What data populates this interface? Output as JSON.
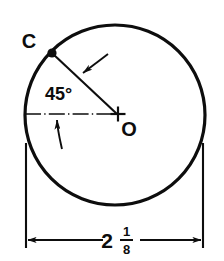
{
  "drawing": {
    "type": "engineering-drawing",
    "subject": "circle-with-angular-and-diameter-dimensions",
    "background_color": "#ffffff",
    "line_color": "#0d0d0d",
    "geometry": {
      "circle": {
        "center_x": 115,
        "center_y": 115,
        "radius": 90,
        "stroke_width": 3.2
      },
      "center_mark": {
        "x": 118,
        "y": 114,
        "arm_length": 7
      },
      "point_c": {
        "x": 52,
        "y": 53,
        "marker_radius": 4.5
      },
      "radius_line": {
        "from_x": 52,
        "from_y": 53,
        "to_x": 117,
        "to_y": 114
      },
      "center_line": {
        "from_x": 25,
        "from_y": 114,
        "to_x": 118,
        "to_y": 114,
        "style": "dash-dot"
      }
    },
    "labels": {
      "point_c": "C",
      "point_o": "O",
      "angle": "45°",
      "angle_value": 45,
      "angle_units": "degrees"
    },
    "dimension": {
      "whole": "2",
      "numerator": "1",
      "denominator": "8",
      "value_text": "2 1/8",
      "decimal_value": 2.125,
      "line_y": 240,
      "left_x": 26,
      "right_x": 203,
      "extension_top_y": 143,
      "extension_bottom_y": 248
    },
    "leaders": {
      "upper_arrow": {
        "from_x": 106,
        "from_y": 55,
        "to_x": 82,
        "to_y": 74,
        "points_to": "radius-line"
      },
      "lower_arrow": {
        "from_x": 60,
        "from_y": 146,
        "to_x": 57,
        "to_y": 118,
        "points_to": "center-line"
      }
    }
  }
}
